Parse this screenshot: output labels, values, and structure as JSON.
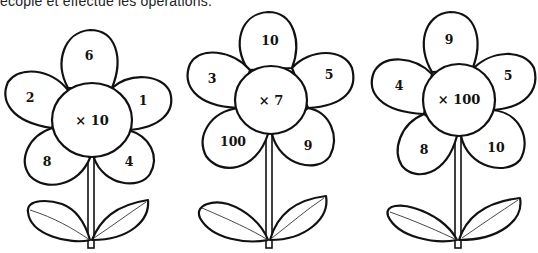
{
  "instruction": "ecopie et effectue les opérations.",
  "flowers": [
    {
      "center_label": "× 10",
      "operator": "×",
      "multiplier": 10,
      "petals": {
        "top": "6",
        "upper_left": "2",
        "upper_right": "1",
        "lower_left": "8",
        "lower_right": "4"
      }
    },
    {
      "center_label": "× 7",
      "operator": "×",
      "multiplier": 7,
      "petals": {
        "top": "10",
        "upper_left": "3",
        "upper_right": "5",
        "lower_left": "100",
        "lower_right": "9"
      }
    },
    {
      "center_label": "× 100",
      "operator": "×",
      "multiplier": 100,
      "petals": {
        "top": "9",
        "upper_left": "4",
        "upper_right": "5",
        "lower_left": "8",
        "lower_right": "10"
      }
    }
  ]
}
